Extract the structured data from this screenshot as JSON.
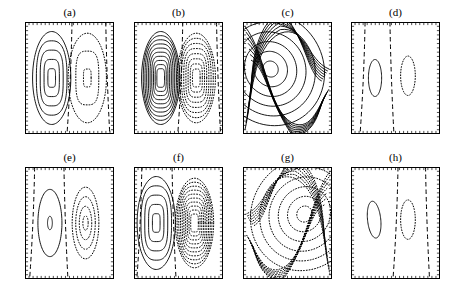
{
  "figure": {
    "title": "",
    "background_color": "#ffffff",
    "line_color": "#000000",
    "columns": 4,
    "rows": 2,
    "panel_width": 89,
    "panel_height": 112,
    "panel_origins_x": [
      25,
      134,
      243,
      351
    ],
    "panel_origins_y": [
      22,
      167
    ]
  },
  "chart_data": {
    "type": "line",
    "title": "",
    "subtitle": "",
    "xlabel": "",
    "ylabel": "",
    "grid": false,
    "legend_position": "none",
    "line_styles": {
      "positive": "solid",
      "negative": "dotted",
      "zero": "dashed"
    },
    "axis_ranges": {
      "x": [
        0,
        1
      ],
      "y": [
        0,
        1
      ]
    },
    "tick_labels": {
      "x": [],
      "y": []
    },
    "panels": [
      {
        "label": "(a)",
        "row": 0,
        "col": 0,
        "positive_cell_center": [
          0.3,
          0.5
        ],
        "negative_cell_center": [
          0.7,
          0.5
        ],
        "positive_contour_count": 5,
        "negative_contour_count": 3,
        "zero_contour_count": 2,
        "zero_contour_x": [
          0.5,
          0.93
        ],
        "cell_shape": "rounded-rectangular",
        "annotations": []
      },
      {
        "label": "(b)",
        "row": 0,
        "col": 1,
        "positive_cell_center": [
          0.3,
          0.5
        ],
        "negative_cell_center": [
          0.7,
          0.5
        ],
        "positive_contour_count": 10,
        "negative_contour_count": 8,
        "zero_contour_count": 2,
        "zero_contour_x": [
          0.52,
          0.95
        ],
        "cell_shape": "rounded-rectangular",
        "annotations": []
      },
      {
        "label": "(c)",
        "row": 0,
        "col": 2,
        "positive_cell_center": [
          0.31,
          0.42
        ],
        "negative_cell_center": null,
        "positive_contour_count": 10,
        "negative_contour_count": 0,
        "zero_contour_count": 0,
        "zero_contour_x": [],
        "cell_shape": "tilted-elliptical-with-saddle",
        "annotations": [
          "saddle point near right edge"
        ]
      },
      {
        "label": "(d)",
        "row": 0,
        "col": 3,
        "positive_cell_center": [
          0.27,
          0.5
        ],
        "negative_cell_center": [
          0.64,
          0.48
        ],
        "positive_contour_count": 1,
        "negative_contour_count": 1,
        "zero_contour_count": 2,
        "zero_contour_x": [
          0.13,
          0.46
        ],
        "cell_shape": "elliptical",
        "annotations": []
      },
      {
        "label": "(e)",
        "row": 1,
        "col": 0,
        "positive_cell_center": [
          0.28,
          0.5
        ],
        "negative_cell_center": [
          0.68,
          0.5
        ],
        "positive_contour_count": 2,
        "negative_contour_count": 4,
        "zero_contour_count": 2,
        "zero_contour_x": [
          0.08,
          0.46
        ],
        "cell_shape": "elliptical",
        "annotations": []
      },
      {
        "label": "(f)",
        "row": 1,
        "col": 1,
        "positive_cell_center": [
          0.25,
          0.5
        ],
        "negative_cell_center": [
          0.68,
          0.5
        ],
        "positive_contour_count": 5,
        "negative_contour_count": 10,
        "zero_contour_count": 2,
        "zero_contour_x": [
          0.06,
          0.45
        ],
        "cell_shape": "rounded-rectangular",
        "annotations": []
      },
      {
        "label": "(g)",
        "row": 1,
        "col": 2,
        "positive_cell_center": null,
        "negative_cell_center": [
          0.62,
          0.48
        ],
        "positive_contour_count": 0,
        "negative_contour_count": 10,
        "zero_contour_count": 0,
        "zero_contour_x": [],
        "cell_shape": "tilted-elliptical-with-saddle",
        "annotations": [
          "saddle point near left edge"
        ]
      },
      {
        "label": "(h)",
        "row": 1,
        "col": 3,
        "positive_cell_center": [
          0.26,
          0.47
        ],
        "negative_cell_center": [
          0.64,
          0.47
        ],
        "positive_contour_count": 1,
        "negative_contour_count": 1,
        "zero_contour_count": 2,
        "zero_contour_x": [
          0.5,
          0.86
        ],
        "cell_shape": "elliptical",
        "annotations": []
      }
    ]
  }
}
